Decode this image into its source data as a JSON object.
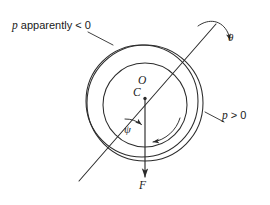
{
  "figure": {
    "kind": "mechanics-diagram",
    "stroke_color": "#2b2b2b",
    "text_color": "#1a1a1a",
    "background_color": "#ffffff",
    "width": 270,
    "height": 205
  },
  "labels": {
    "p_negative": {
      "symbol": "p",
      "words": "apparently",
      "relation": "< 0",
      "full": "p apparently < 0"
    },
    "p_positive": {
      "symbol": "p",
      "relation": "> 0",
      "full": "p > 0"
    },
    "centre_O": "O",
    "centre_C": "C",
    "angle_psi": "ψ",
    "angle_theta": "θ",
    "force_F": "F"
  },
  "geometry": {
    "outer_circle": {
      "cx": 145,
      "cy": 103,
      "r": 58
    },
    "second_circle": {
      "cx": 142,
      "cy": 101,
      "r": 56
    },
    "inner_circle": {
      "cx": 145,
      "cy": 105,
      "r": 42
    },
    "point_C": {
      "x": 145,
      "y": 98
    },
    "diagonal_line": {
      "x1": 79,
      "y1": 181,
      "x2": 216,
      "y2": 24
    },
    "force_line": {
      "x1": 145,
      "y1": 98,
      "x2": 145,
      "y2": 180
    },
    "psi_arc_radius": 26,
    "spin_arrow": "counterclockwise-inner",
    "theta_arrow": "curved-top-right",
    "leader_p_negative": {
      "x1": 88,
      "y1": 32,
      "x2": 113,
      "y2": 45
    },
    "leader_p_positive": {
      "x1": 205,
      "y1": 112,
      "x2": 224,
      "y2": 122
    }
  }
}
